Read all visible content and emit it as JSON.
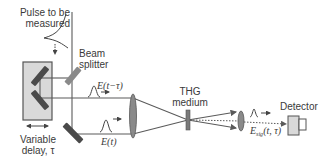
{
  "diagram": {
    "type": "optical-setup",
    "labels": {
      "pulse_in_line1": "Pulse to be",
      "pulse_in_line2": "measured",
      "beam_splitter_line1": "Beam",
      "beam_splitter_line2": "splitter",
      "delay_line1": "Variable",
      "delay_line2": "delay, τ",
      "thg_line1": "THG",
      "thg_line2": "medium",
      "detector": "Detector",
      "field_delayed": "E(t−τ)",
      "field_ref": "E(t)",
      "field_sig_main": "E",
      "field_sig_sub": "sig",
      "field_sig_args": "(t, τ)"
    },
    "components": [
      {
        "name": "input-pulse",
        "label": "Pulse to be measured"
      },
      {
        "name": "beam-splitter",
        "label": "Beam splitter"
      },
      {
        "name": "variable-delay-stage",
        "label": "Variable delay, τ"
      },
      {
        "name": "focusing-lens"
      },
      {
        "name": "thg-medium",
        "label": "THG medium"
      },
      {
        "name": "collimating-lens"
      },
      {
        "name": "detector",
        "label": "Detector"
      }
    ],
    "colors": {
      "beam": "#5a5a5a",
      "mirror": "#4a4a4a",
      "splitter": "#8a8a8a",
      "stage_fill": "#d9d9d9",
      "stage_stroke": "#555555",
      "lens": "#7a7a7a",
      "text": "#3a3a3a"
    }
  }
}
